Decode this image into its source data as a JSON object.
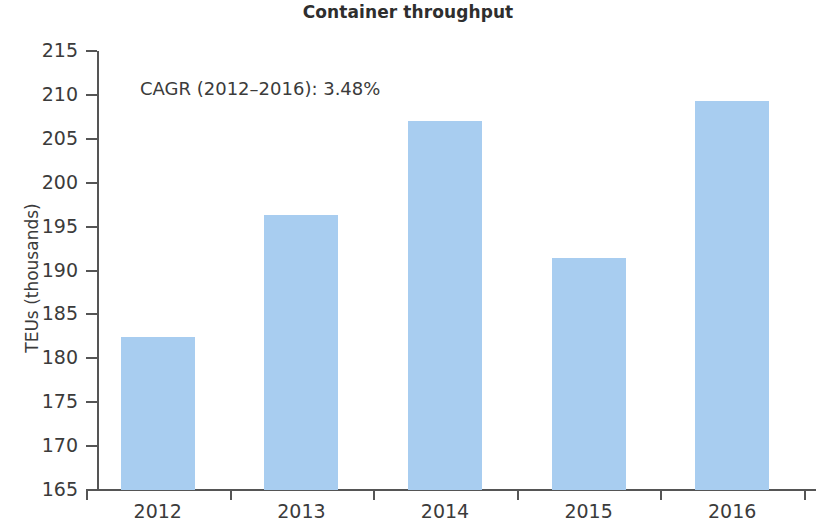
{
  "chart_data": {
    "type": "bar",
    "title": "Container throughput",
    "subtitle": "",
    "xlabel": "",
    "ylabel": "TEUs (thousands)",
    "categories": [
      "2012",
      "2013",
      "2014",
      "2015",
      "2016"
    ],
    "values": [
      182.4,
      196.3,
      207.0,
      191.4,
      209.3
    ],
    "series": [
      {
        "name": "Container throughput",
        "values": [
          182.4,
          196.3,
          207.0,
          191.4,
          209.3
        ]
      }
    ],
    "ylim": [
      165,
      215
    ],
    "ytick_labels": [
      "215",
      "210",
      "205",
      "200",
      "195",
      "190",
      "185",
      "180",
      "175",
      "170",
      "165"
    ],
    "ytick_values": [
      215,
      210,
      205,
      200,
      195,
      190,
      185,
      180,
      175,
      170,
      165
    ],
    "xtick_labels": [
      "2012",
      "2013",
      "2014",
      "2015",
      "2016"
    ],
    "grid": false,
    "legend": false,
    "legend_position": "none",
    "bar_color": "#a8cdf0",
    "axis_color": "#555555",
    "text_color": "#3b3b3b",
    "annotations": [
      {
        "name": "cagr-note",
        "text": "CAGR (2012–2016): 3.48%",
        "value": 3.48,
        "period_start": 2012,
        "period_end": 2016
      }
    ]
  }
}
